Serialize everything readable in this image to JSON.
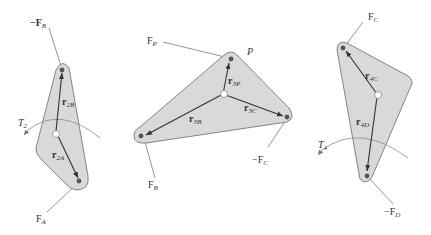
{
  "figure": {
    "link2": {
      "force_top_label": "−F",
      "force_top_sub": "B",
      "force_bottom_label": "F",
      "force_bottom_sub": "A",
      "vec_upper_label": "r",
      "vec_upper_sub": "2B",
      "vec_lower_label": "r",
      "vec_lower_sub": "2A",
      "torque_label": "T",
      "torque_sub": "2"
    },
    "link3": {
      "force_p_label": "F",
      "force_p_sub": "P",
      "point_label": "P",
      "force_b_label": "F",
      "force_b_sub": "B",
      "force_c_label": "−F",
      "force_c_sub": "C",
      "vec_p_label": "r",
      "vec_p_sub": "3P",
      "vec_b_label": "r",
      "vec_b_sub": "3B",
      "vec_c_label": "r",
      "vec_c_sub": "3C"
    },
    "link4": {
      "force_top_label": "F",
      "force_top_sub": "C",
      "force_bottom_label": "−F",
      "force_bottom_sub": "D",
      "vec_upper_label": "r",
      "vec_upper_sub": "4C",
      "vec_lower_label": "r",
      "vec_lower_sub": "4D",
      "torque_label": "T",
      "torque_sub": "4"
    }
  },
  "colors": {
    "body_fill": "#d9d9d9",
    "outline": "#6a6a6a",
    "vector": "#333333",
    "background": "#ffffff"
  }
}
